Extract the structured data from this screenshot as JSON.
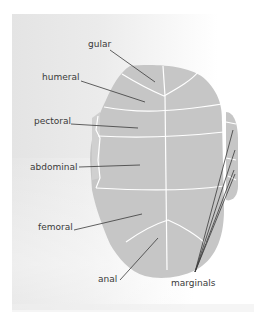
{
  "diagram": {
    "colors": {
      "plastron_fill": "#c6c6c6",
      "seam_lines": "#ffffff",
      "leader_lines": "#3a3a3a",
      "label_text": "#3a3a3a",
      "background_panel": "#e6e6e6"
    },
    "labels": {
      "gular": "gular",
      "humeral": "humeral",
      "pectoral": "pectoral",
      "abdominal": "abdominal",
      "femoral": "femoral",
      "anal": "anal",
      "marginals": "marginals"
    }
  }
}
